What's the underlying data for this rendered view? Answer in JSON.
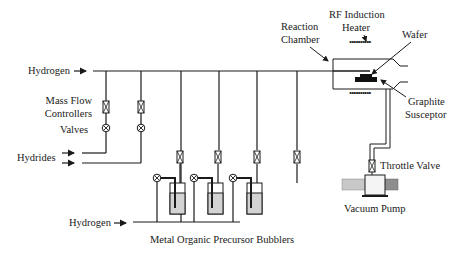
{
  "labels": {
    "hydrogen_top": "Hydrogen",
    "mass_flow_line1": "Mass Flow",
    "mass_flow_line2": "Controllers",
    "valves": "Valves",
    "hydrides": "Hydrides",
    "hydrogen_bottom": "Hydrogen",
    "bubblers": "Metal Organic Precursor Bubblers",
    "reaction_line1": "Reaction",
    "reaction_line2": "Chamber",
    "rf_line1": "RF Induction",
    "rf_line2": "Heater",
    "wafer": "Wafer",
    "graphite_line1": "Graphite",
    "graphite_line2": "Susceptor",
    "throttle": "Throttle Valve",
    "vacuum": "Vacuum Pump"
  },
  "colors": {
    "line": "#1a1a1a",
    "liquid": "#d3d3d3",
    "pump_left": "#c8c8c8",
    "pump_right": "#8e8e8e",
    "pump_body": "#f4f4f4"
  },
  "components": {
    "mass_flow_controllers": 6,
    "valves": 5,
    "bubblers": 3
  }
}
